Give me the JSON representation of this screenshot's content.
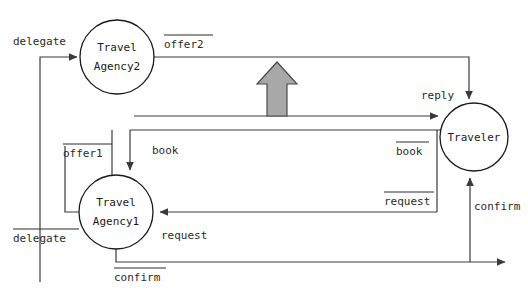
{
  "diagram": {
    "background_color": "#ffffff",
    "line_color": "#3a3a3a",
    "text_color": "#1a1a1a",
    "highlight_arrow_color": "#a8a8a8",
    "highlight_arrow_stroke": "#4a4a4a",
    "nodes": [
      {
        "id": "agency2",
        "label_line1": "Travel",
        "label_line2": "Agency2",
        "cx": 117,
        "cy": 57,
        "r": 37
      },
      {
        "id": "agency1",
        "label_line1": "Travel",
        "label_line2": "Agency1",
        "cx": 116,
        "cy": 212,
        "r": 37
      },
      {
        "id": "traveler",
        "label_line1": "Traveler",
        "label_line2": "",
        "cx": 474,
        "cy": 137,
        "r": 34
      }
    ],
    "edge_labels": [
      {
        "id": "delegate-top",
        "text": "delegate",
        "overline": false,
        "x": 13,
        "y": 42
      },
      {
        "id": "offer2",
        "text": "offer2",
        "overline": true,
        "x": 164,
        "y": 45
      },
      {
        "id": "reply",
        "text": "reply",
        "overline": false,
        "x": 421,
        "y": 96
      },
      {
        "id": "offer1",
        "text": "offer1",
        "overline": true,
        "x": 63,
        "y": 154
      },
      {
        "id": "book-left",
        "text": "book",
        "overline": false,
        "x": 152,
        "y": 151
      },
      {
        "id": "book-right",
        "text": "book",
        "overline": true,
        "x": 396,
        "y": 152
      },
      {
        "id": "request-right",
        "text": "request",
        "overline": true,
        "x": 384,
        "y": 202
      },
      {
        "id": "confirm-right",
        "text": "confirm",
        "overline": false,
        "x": 474,
        "y": 207
      },
      {
        "id": "delegate-bottom",
        "text": "delegate",
        "overline": true,
        "x": 13,
        "y": 239
      },
      {
        "id": "request-bottom",
        "text": "request",
        "overline": false,
        "x": 161,
        "y": 236
      },
      {
        "id": "confirm-bottom",
        "text": "confirm",
        "overline": true,
        "x": 114,
        "y": 278
      }
    ],
    "messages": [
      {
        "name": "delegate",
        "from": "Traveler",
        "to": "TravelAgency2",
        "dual": false
      },
      {
        "name": "offer2",
        "from": "TravelAgency2",
        "to": "Traveler",
        "dual": true
      },
      {
        "name": "reply",
        "from": "Traveler",
        "to": "Traveler",
        "dual": false
      },
      {
        "name": "offer1",
        "from": "TravelAgency1",
        "to": "Traveler",
        "dual": true
      },
      {
        "name": "book",
        "from": "Traveler",
        "to": "TravelAgency1",
        "dual": false
      },
      {
        "name": "book",
        "from": "Traveler",
        "to": "TravelAgency1",
        "dual": true
      },
      {
        "name": "request",
        "from": "Traveler",
        "to": "TravelAgency1",
        "dual": true
      },
      {
        "name": "request",
        "from": "TravelAgency1",
        "to": "Traveler",
        "dual": false
      },
      {
        "name": "confirm",
        "from": "TravelAgency1",
        "to": "Traveler",
        "dual": true
      },
      {
        "name": "confirm",
        "from": "TravelAgency1",
        "to": "Traveler",
        "dual": false
      }
    ],
    "highlight_arrow": {
      "name": "up-arrow",
      "direction": "up",
      "tip_x": 277,
      "tip_y": 62,
      "tail_y": 116
    }
  }
}
